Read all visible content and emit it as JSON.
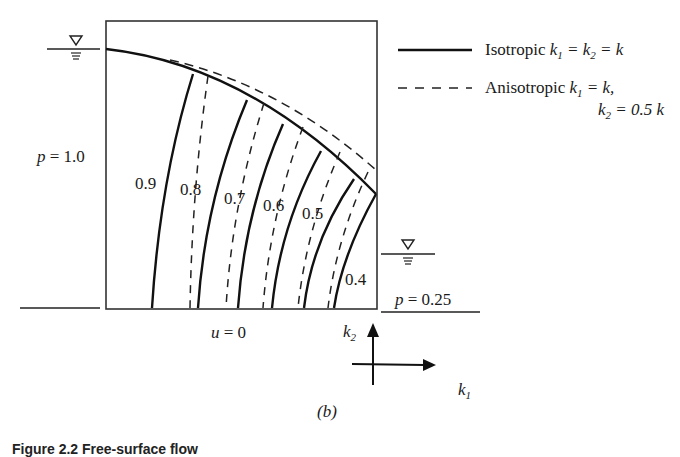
{
  "figure": {
    "panel_label": "(b)",
    "caption_partial": "Figure 2.2 Free-surface flow"
  },
  "legend": {
    "isotropic": {
      "style": "solid",
      "text_prefix": "Isotropic ",
      "equation": "k1 = k2 = k"
    },
    "anisotropic": {
      "style": "dashed",
      "text_prefix": "Anisotropic ",
      "equation_line1": "k1 = k,",
      "equation_line2": "k2 = 0.5 k"
    }
  },
  "boundary_labels": {
    "left": "p = 1.0",
    "right": "p = 0.25",
    "bottom": "u = 0"
  },
  "contours": {
    "labels": [
      "0.9",
      "0.8",
      "0.7",
      "0.6",
      "0.5",
      "0.4"
    ]
  },
  "axes": {
    "x_label": "k1",
    "y_label": "k2"
  },
  "water_table_symbols": [
    "left-upstream",
    "right-downstream"
  ]
}
